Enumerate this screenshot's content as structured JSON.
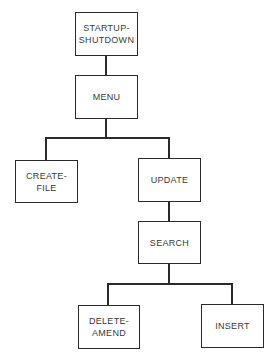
{
  "diagram": {
    "type": "hierarchy",
    "nodes": [
      {
        "id": "startup",
        "label": "STARTUP-\nSHUTDOWN"
      },
      {
        "id": "menu",
        "label": "MENU"
      },
      {
        "id": "create",
        "label": "CREATE-\nFILE"
      },
      {
        "id": "update",
        "label": "UPDATE"
      },
      {
        "id": "search",
        "label": "SEARCH"
      },
      {
        "id": "delete",
        "label": "DELETE-\nAMEND"
      },
      {
        "id": "insert",
        "label": "INSERT"
      }
    ],
    "edges": [
      [
        "startup",
        "menu"
      ],
      [
        "menu",
        "create"
      ],
      [
        "menu",
        "update"
      ],
      [
        "update",
        "search"
      ],
      [
        "search",
        "delete"
      ],
      [
        "search",
        "insert"
      ]
    ]
  }
}
